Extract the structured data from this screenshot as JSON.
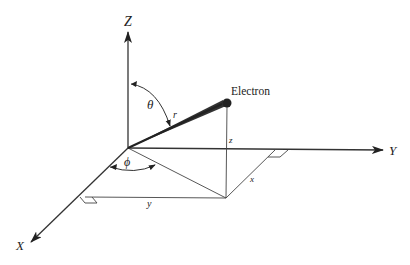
{
  "diagram": {
    "type": "3d-spherical-coordinates",
    "axes": {
      "z": {
        "label": "Z"
      },
      "y": {
        "label": "Y"
      },
      "x": {
        "label": "X"
      }
    },
    "point": {
      "label": "Electron"
    },
    "angles": {
      "theta": {
        "label": "θ"
      },
      "phi": {
        "label": "ϕ"
      }
    },
    "segments": {
      "radius": {
        "label": "r"
      },
      "z_component": {
        "label": "z"
      },
      "x_component": {
        "label": "x"
      },
      "y_component": {
        "label": "y"
      }
    },
    "colors": {
      "stroke": "#333333",
      "text": "#222222",
      "background": "#ffffff"
    }
  }
}
